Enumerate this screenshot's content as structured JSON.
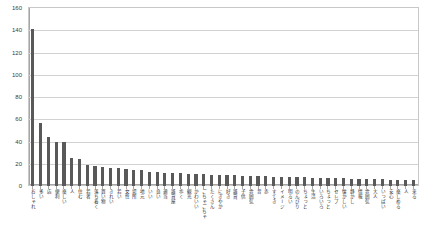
{
  "chart_data": {
    "type": "bar",
    "title": "",
    "subtitle": "",
    "xlabel": "",
    "ylabel": "",
    "ylim": [
      0,
      160
    ],
    "ytick_step": 20,
    "yticks": [
      "0",
      "20",
      "40",
      "60",
      "80",
      "100",
      "120",
      "140",
      "160"
    ],
    "grid": true,
    "legend": false,
    "bar_color": "#595959",
    "categories": [
      "おしゃれ",
      "多い",
      "店",
      "便利",
      "楽しい",
      "人",
      "住む",
      "若者",
      "落ち着く",
      "買い物",
      "きれい",
      "若い",
      "女性",
      "場所",
      "地元",
      "いい",
      "良い",
      "適当",
      "雑貨屋",
      "歩く",
      "観光",
      "かわいい",
      "ごちゃごちゃ",
      "たくさん",
      "にぎやか",
      "好き",
      "雑貨",
      "子供",
      "雰囲気",
      "昔",
      "赤",
      "すてき",
      "イメージ",
      "明るい",
      "のんびり",
      "ちょっと",
      "生活",
      "いろいろ",
      "ちょっと",
      "セレブ",
      "懐かしい",
      "静かし",
      "情報",
      "雰囲気",
      "大人",
      "いっぱい",
      "安心",
      "楽しめる",
      "人",
      "来る"
    ],
    "values": [
      141,
      57,
      44,
      40,
      40,
      25,
      24,
      19,
      18,
      17,
      16,
      16,
      15,
      14,
      14,
      13,
      13,
      12,
      12,
      12,
      11,
      11,
      11,
      10,
      10,
      10,
      10,
      9,
      9,
      9,
      9,
      8,
      8,
      8,
      8,
      8,
      7,
      7,
      7,
      7,
      7,
      6,
      6,
      6,
      6,
      6,
      5,
      5,
      5,
      5
    ]
  }
}
